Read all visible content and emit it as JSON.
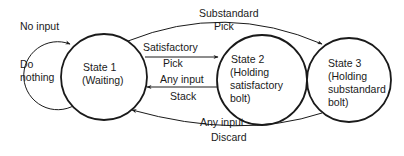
{
  "diagram": {
    "type": "state-transition",
    "states": [
      {
        "id": "state1",
        "lines": [
          "State 1",
          "(Waiting)"
        ]
      },
      {
        "id": "state2",
        "lines": [
          "State 2",
          "(Holding",
          "satisfactory",
          "bolt)"
        ]
      },
      {
        "id": "state3",
        "lines": [
          "State 3",
          "(Holding",
          "substandard",
          "bolt)"
        ]
      }
    ],
    "self_loop": {
      "state": "state1",
      "condition": "No input",
      "action_lines": [
        "Do",
        "nothing"
      ]
    },
    "transitions": [
      {
        "from": "state1",
        "to": "state3",
        "condition": "Substandard",
        "action": "Pick"
      },
      {
        "from": "state1",
        "to": "state2",
        "condition": "Satisfactory",
        "action": "Pick"
      },
      {
        "from": "state2",
        "to": "state1",
        "condition": "Any input",
        "action": "Stack"
      },
      {
        "from": "state3",
        "to": "state1",
        "condition": "Any input",
        "action": "Discard"
      }
    ],
    "colors": {
      "stroke": "#1a1a1a",
      "background": "#ffffff"
    }
  }
}
